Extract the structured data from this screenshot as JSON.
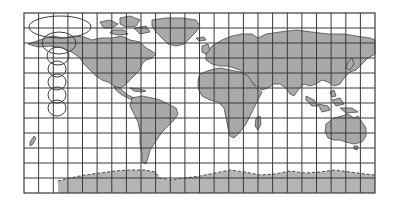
{
  "figure": {
    "title": "",
    "type": "world map with graticule and distortion ellipses",
    "colors": {
      "background": "#ffffff",
      "land": "#a9a9a9",
      "coastline": "#4a4a4a",
      "grid": "#3a3a3a",
      "antarctica": "#b5b5b5"
    },
    "frame": {
      "x": 24,
      "y": 13,
      "width": 351,
      "height": 180
    },
    "grid": {
      "columns": 24,
      "rows": 12
    },
    "tissot_indicatrices": [
      {
        "cx": 60,
        "cy": 27,
        "rx": 31,
        "ry": 11
      },
      {
        "cx": 59,
        "cy": 43,
        "rx": 17,
        "ry": 11
      },
      {
        "cx": 58,
        "cy": 56,
        "rx": 11,
        "ry": 9
      },
      {
        "cx": 57,
        "cy": 69,
        "rx": 9,
        "ry": 8
      },
      {
        "cx": 57,
        "cy": 82,
        "rx": 9,
        "ry": 8
      },
      {
        "cx": 57,
        "cy": 95,
        "rx": 9,
        "ry": 8
      },
      {
        "cx": 57,
        "cy": 108,
        "rx": 9,
        "ry": 8
      }
    ],
    "landmasses": [
      "north-america",
      "greenland",
      "south-america",
      "europe-asia",
      "africa",
      "australia",
      "antarctica",
      "arctic-islands",
      "madagascar",
      "new-zealand",
      "southeast-asia-islands",
      "japan",
      "british-isles"
    ]
  }
}
